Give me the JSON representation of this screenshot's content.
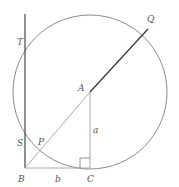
{
  "diagram": {
    "colors": {
      "circle": "#8a8a8a",
      "segment_dark": "#333333",
      "segment_light": "#aaaaaa",
      "label": "#555555"
    },
    "points": {
      "T": {
        "label": "T"
      },
      "Q": {
        "label": "Q"
      },
      "A": {
        "label": "A"
      },
      "S": {
        "label": "S"
      },
      "P": {
        "label": "P"
      },
      "B": {
        "label": "B"
      },
      "C": {
        "label": "C"
      }
    },
    "lengths": {
      "a": {
        "label": "a"
      },
      "b": {
        "label": "b"
      }
    }
  }
}
